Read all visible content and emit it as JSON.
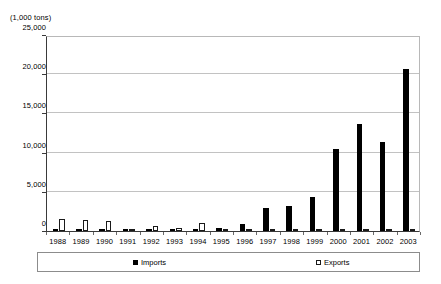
{
  "chart_data": {
    "type": "bar",
    "title": "",
    "subtitle": "",
    "unit_caption": "(1,000 tons)",
    "xlabel": "",
    "ylabel": "",
    "ylim": [
      0,
      25000
    ],
    "ytick_labels": [
      "0",
      "5,000",
      "10,000",
      "15,000",
      "20,000",
      "25,000"
    ],
    "ytick_values": [
      0,
      5000,
      10000,
      15000,
      20000,
      25000
    ],
    "grid": true,
    "legend_position": "bottom",
    "categories": [
      "1988",
      "1989",
      "1990",
      "1991",
      "1992",
      "1993",
      "1994",
      "1995",
      "1996",
      "1997",
      "1998",
      "1999",
      "2000",
      "2001",
      "2002",
      "2003"
    ],
    "series": [
      {
        "name": "Imports",
        "color": "#000000",
        "style": "filled",
        "values": [
          300,
          150,
          150,
          100,
          100,
          150,
          200,
          400,
          900,
          2900,
          3200,
          4300,
          10400,
          13700,
          11400,
          20700
        ]
      },
      {
        "name": "Exports",
        "color": "#ffffff",
        "style": "open",
        "values": [
          1500,
          1400,
          1300,
          200,
          700,
          400,
          1000,
          200,
          150,
          150,
          150,
          150,
          200,
          200,
          200,
          200
        ]
      }
    ]
  },
  "legend": {
    "items": [
      {
        "label": "Imports",
        "swatch": "filled-square-icon"
      },
      {
        "label": "Exports",
        "swatch": "open-square-icon"
      }
    ]
  }
}
